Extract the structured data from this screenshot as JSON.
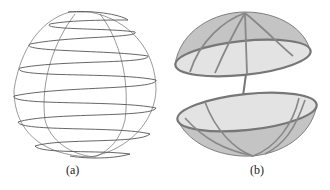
{
  "figure": {
    "panels": [
      {
        "id": "a",
        "caption": "(a)",
        "description": "spherical spiral curve wound around a sphere"
      },
      {
        "id": "b",
        "caption": "(b)",
        "description": "hollow sphere split into two hemispherical shells connected by a rod, with meridian bands"
      }
    ],
    "colors": {
      "line": "#555555",
      "shell_fill": "#c9c9c9",
      "shell_inner": "#e2e2e2",
      "band": "#8a8a8a"
    }
  }
}
